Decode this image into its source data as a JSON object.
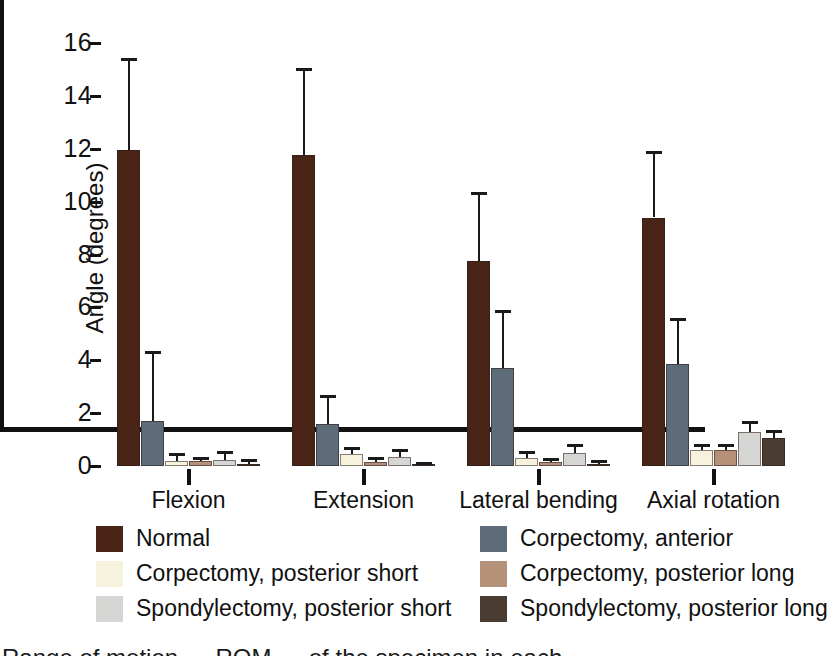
{
  "chart_data": {
    "type": "bar",
    "title": "",
    "xlabel": "",
    "ylabel": "Angle (degrees)",
    "ylim": [
      0,
      16
    ],
    "yticks": [
      0,
      2,
      4,
      6,
      8,
      10,
      12,
      14,
      16
    ],
    "grid": false,
    "legend_position": "below-plot",
    "categories": [
      "Flexion",
      "Extension",
      "Lateral bending",
      "Axial rotation"
    ],
    "series": [
      {
        "name": "Normal",
        "color": "#4a2417",
        "values": [
          11.95,
          11.75,
          7.75,
          9.4
        ],
        "errors": [
          3.5,
          3.3,
          2.6,
          2.5
        ]
      },
      {
        "name": "Corpectomy, anterior",
        "color": "#5e6b79",
        "values": [
          1.7,
          1.6,
          3.7,
          3.85
        ],
        "errors": [
          2.65,
          1.1,
          2.2,
          1.75
        ]
      },
      {
        "name": "Corpectomy, posterior short",
        "color": "#f7f2de",
        "values": [
          0.18,
          0.45,
          0.3,
          0.6
        ],
        "errors": [
          0.3,
          0.25,
          0.25,
          0.25
        ]
      },
      {
        "name": "Corpectomy, posterior long",
        "color": "#b59179",
        "values": [
          0.2,
          0.15,
          0.15,
          0.6
        ],
        "errors": [
          0.15,
          0.2,
          0.15,
          0.25
        ]
      },
      {
        "name": "Spondylectomy, posterior short",
        "color": "#d5d6d4",
        "values": [
          0.22,
          0.35,
          0.5,
          1.3
        ],
        "errors": [
          0.35,
          0.3,
          0.35,
          0.4
        ]
      },
      {
        "name": "Spondylectomy, posterior long",
        "color": "#4a3c31",
        "values": [
          0.08,
          0.05,
          0.08,
          1.05
        ],
        "errors": [
          0.2,
          0.12,
          0.15,
          0.3
        ]
      }
    ]
  },
  "legend": {
    "entries": [
      {
        "label": "Normal",
        "color": "#4a2417"
      },
      {
        "label": "Corpectomy, anterior",
        "color": "#5e6b79"
      },
      {
        "label": "Corpectomy, posterior short",
        "color": "#f7f2de"
      },
      {
        "label": "Corpectomy, posterior long",
        "color": "#b59179"
      },
      {
        "label": "Spondylectomy, posterior short",
        "color": "#d5d6d4"
      },
      {
        "label": "Spondylectomy, posterior long",
        "color": "#4a3c31"
      }
    ],
    "order": [
      0,
      1,
      2,
      3,
      4,
      5
    ]
  },
  "caption": "Range of motion — ROM — of the specimen in each",
  "axis": {
    "y_title": "Angle (degrees)"
  }
}
